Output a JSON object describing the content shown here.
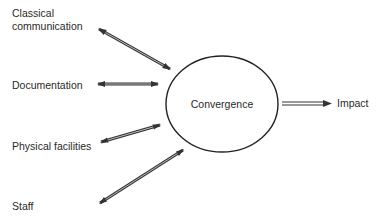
{
  "diagram": {
    "center_node": {
      "label": "Convergence"
    },
    "inputs": [
      {
        "id": "classical-communication",
        "line1": "Classical",
        "line2": "communication"
      },
      {
        "id": "documentation",
        "line1": "Documentation"
      },
      {
        "id": "physical-facilities",
        "line1": "Physical facilities"
      },
      {
        "id": "staff",
        "line1": "Staff"
      }
    ],
    "output": {
      "label": "Impact"
    },
    "colors": {
      "line": "#333333",
      "text": "#2a2a2a",
      "background": "#ffffff"
    }
  }
}
